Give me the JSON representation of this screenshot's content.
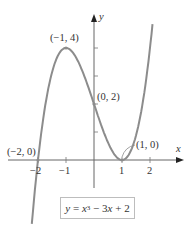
{
  "chart_data": {
    "type": "line",
    "title": "",
    "equation": "y = x^3 - 3x + 2",
    "xlabel": "x",
    "ylabel": "y",
    "xlim": [
      -2.8,
      3.0
    ],
    "ylim": [
      -2.6,
      5.2
    ],
    "x_ticks": [
      -2,
      -1,
      1,
      2
    ],
    "x_tick_labels": [
      "−2",
      "−1",
      "1",
      "2"
    ],
    "y_ticks": [
      1,
      2,
      3,
      4
    ],
    "grid": false,
    "series": [
      {
        "name": "y = x^3 - 3x + 2",
        "color": "#8c8c8c",
        "x": [
          -2.3,
          -2,
          -1.5,
          -1,
          -0.5,
          0,
          0.5,
          1,
          1.5,
          2,
          2.3
        ],
        "y": [
          -3.267,
          0,
          3.125,
          4,
          3.375,
          2,
          0.625,
          0,
          0.875,
          4,
          7.267
        ]
      }
    ],
    "annotations": [
      {
        "text": "(−1, 4)",
        "x": -1,
        "y": 4
      },
      {
        "text": "(0, 2)",
        "x": 0,
        "y": 2
      },
      {
        "text": "(1, 0)",
        "x": 1,
        "y": 0
      },
      {
        "text": "(−2, 0)",
        "x": -2,
        "y": 0
      }
    ]
  },
  "labels": {
    "axis_x": "x",
    "axis_y": "y",
    "point_max": "(−1, 4)",
    "point_yint": "(0, 2)",
    "point_min": "(1, 0)",
    "point_root": "(−2, 0)",
    "tick_neg2": "−2",
    "tick_neg1": "−1",
    "tick_1": "1",
    "tick_2": "2"
  },
  "equation": {
    "lhs": "y",
    "eq": " = ",
    "var": "x",
    "exp": "3",
    "rest1": " − 3",
    "var2": "x",
    "rest2": " + 2"
  },
  "colors": {
    "curve": "#8c8c8c",
    "axis": "#666666",
    "text": "#333333"
  }
}
